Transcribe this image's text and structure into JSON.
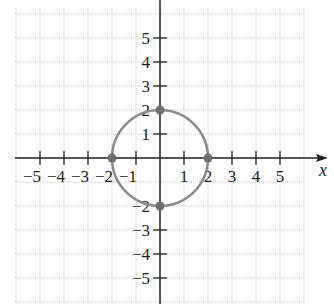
{
  "chart_data": {
    "type": "scatter",
    "title": "",
    "xlabel": "x",
    "ylabel": "",
    "xlim": [
      -6,
      6
    ],
    "ylim": [
      -6,
      6
    ],
    "grid": true,
    "x_ticks": [
      -5,
      -4,
      -3,
      -2,
      -1,
      1,
      2,
      3,
      4,
      5
    ],
    "y_ticks": [
      -5,
      -4,
      -3,
      -2,
      1,
      2,
      3,
      4,
      5
    ],
    "x_tick_labels": [
      "−5",
      "−4",
      "−3",
      "−2",
      "−1",
      "1",
      "2",
      "3",
      "4",
      "5"
    ],
    "y_tick_labels": [
      "−5",
      "−4",
      "−3",
      "−2",
      "1",
      "2",
      "3",
      "4",
      "5"
    ],
    "curves": [
      {
        "name": "circle",
        "equation": "x^2 + y^2 = 4",
        "center": [
          0,
          0
        ],
        "radius": 2,
        "color": "#808080"
      }
    ],
    "points": [
      {
        "x": 2,
        "y": 0
      },
      {
        "x": -2,
        "y": 0
      },
      {
        "x": 0,
        "y": 2
      },
      {
        "x": 0,
        "y": -2
      }
    ]
  },
  "style": {
    "grid_color": "#c8c8c8",
    "axis_color": "#222222",
    "curve_color": "#8a8a8a",
    "point_color": "#6e6e6e"
  }
}
